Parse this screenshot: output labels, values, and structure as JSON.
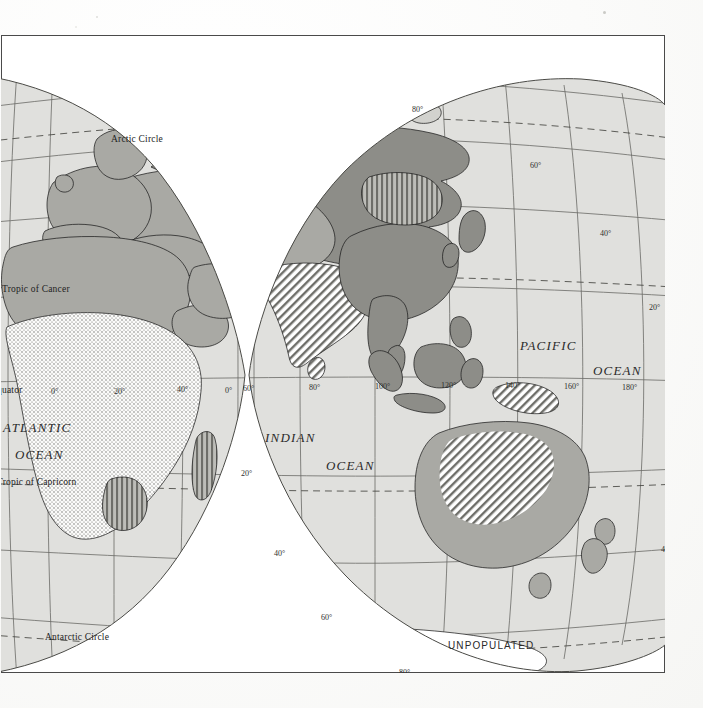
{
  "document": {
    "kind": "scanned-atlas-plate",
    "plate_title": "World Distribution Map — Eastern Hemisphere",
    "projection": "interrupted-oval (Goode-style) eastern lobes"
  },
  "map": {
    "ocean_labels": [
      {
        "id": "atlantic-1",
        "text": "ATLANTIC",
        "x": 2,
        "y": 385
      },
      {
        "id": "atlantic-2",
        "text": "OCEAN",
        "x": 14,
        "y": 412
      },
      {
        "id": "indian-1",
        "text": "INDIAN",
        "x": 264,
        "y": 395
      },
      {
        "id": "indian-2",
        "text": "OCEAN",
        "x": 325,
        "y": 423
      },
      {
        "id": "pacific-1",
        "text": "PACIFIC",
        "x": 519,
        "y": 303
      },
      {
        "id": "pacific-2",
        "text": "OCEAN",
        "x": 592,
        "y": 328
      }
    ],
    "reference_lines": [
      {
        "id": "arctic-circle",
        "text": "Arctic Circle",
        "x": 110,
        "y": 99
      },
      {
        "id": "tropic-cancer",
        "text": "Tropic of Cancer",
        "x": 1,
        "y": 249
      },
      {
        "id": "equator",
        "text": "Equator",
        "x": -10,
        "y": 350
      },
      {
        "id": "tropic-capricorn",
        "text": "Tropic of Capricorn",
        "x": -4,
        "y": 442
      },
      {
        "id": "antarctic-circle",
        "text": "Antarctic Circle",
        "x": 44,
        "y": 597
      }
    ],
    "area_labels": [
      {
        "id": "unpopulated",
        "text": "UNPOPULATED",
        "x": 447,
        "y": 605
      }
    ],
    "graticule_labels": [
      {
        "id": "lat-80n",
        "text": "80°",
        "x": 411,
        "y": 70
      },
      {
        "id": "lat-60n",
        "text": "60°",
        "x": 529,
        "y": 126
      },
      {
        "id": "lat-40n",
        "text": "40°",
        "x": 599,
        "y": 194
      },
      {
        "id": "lat-20n",
        "text": "20°",
        "x": 648,
        "y": 268
      },
      {
        "id": "lon-0a",
        "text": "0°",
        "x": 50,
        "y": 352
      },
      {
        "id": "lon-20e",
        "text": "20°",
        "x": 113,
        "y": 352
      },
      {
        "id": "lon-40e",
        "text": "40°",
        "x": 176,
        "y": 350
      },
      {
        "id": "lon-0b",
        "text": "0°",
        "x": 224,
        "y": 351
      },
      {
        "id": "lon-60e",
        "text": "60°",
        "x": 242,
        "y": 349
      },
      {
        "id": "lon-80e",
        "text": "80°",
        "x": 308,
        "y": 348
      },
      {
        "id": "lon-100e",
        "text": "100°",
        "x": 374,
        "y": 347
      },
      {
        "id": "lon-120e",
        "text": "120°",
        "x": 440,
        "y": 346
      },
      {
        "id": "lon-140e",
        "text": "140°",
        "x": 504,
        "y": 346
      },
      {
        "id": "lon-160e",
        "text": "160°",
        "x": 563,
        "y": 347
      },
      {
        "id": "lon-180",
        "text": "180°",
        "x": 621,
        "y": 348
      },
      {
        "id": "lat-20s",
        "text": "20°",
        "x": 240,
        "y": 434
      },
      {
        "id": "lat-40s",
        "text": "40°",
        "x": 273,
        "y": 514
      },
      {
        "id": "lat-40s-e",
        "text": "40°",
        "x": 660,
        "y": 510
      },
      {
        "id": "lat-60s",
        "text": "60°",
        "x": 320,
        "y": 578
      },
      {
        "id": "lat-80s",
        "text": "80°",
        "x": 398,
        "y": 633
      }
    ]
  },
  "legend_classes": [
    {
      "id": "water",
      "label": "Water / background",
      "color": "#ffffff"
    },
    {
      "id": "sparse",
      "label": "Sparse",
      "color": "#e3e3e0"
    },
    {
      "id": "light-gray",
      "label": "Light",
      "color": "#d2d2ce"
    },
    {
      "id": "mid-gray",
      "label": "Moderate",
      "color": "#a9a9a4"
    },
    {
      "id": "dark-gray",
      "label": "Dense",
      "color": "#8d8d88"
    },
    {
      "id": "darkest-gray",
      "label": "Very dense",
      "color": "#7b7b76"
    },
    {
      "id": "hatch-diag",
      "label": "Diagonal hatch class",
      "color": "#6e6e69"
    },
    {
      "id": "hatch-vert",
      "label": "Vertical hatch class",
      "color": "#6e6e69"
    },
    {
      "id": "stipple",
      "label": "Stipple class",
      "color": "#666661"
    },
    {
      "id": "outline",
      "label": "Coast / border line",
      "color": "#1f1f1f"
    }
  ]
}
